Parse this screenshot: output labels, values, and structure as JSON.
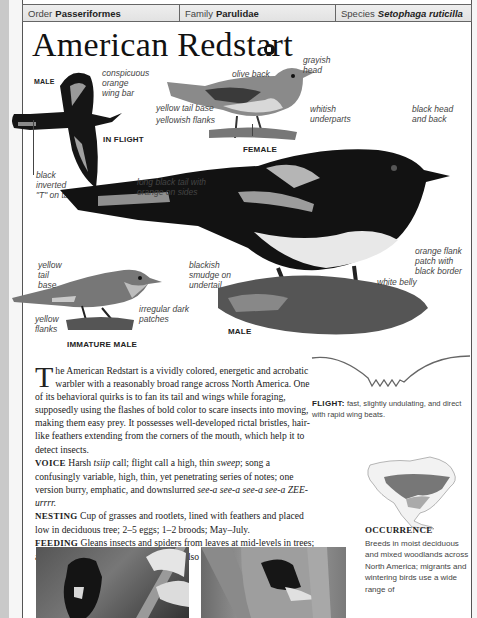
{
  "header": {
    "order_label": "Order",
    "order_value": "Passeriformes",
    "family_label": "Family",
    "family_value": "Parulidae",
    "species_label": "Species",
    "species_value": "Setophaga ruticilla"
  },
  "title": "American Redstart",
  "audio_icon": "speaker-icon",
  "illustrations": {
    "in_flight": {
      "tag": "MALE",
      "caption": "IN FLIGHT",
      "labels": [
        "conspicuous",
        "orange",
        "wing bar",
        "black",
        "inverted",
        "\"T\" on tail"
      ]
    },
    "female": {
      "caption": "FEMALE",
      "labels": [
        "grayish",
        "head",
        "olive back",
        "yellow tail base",
        "yellowish flanks",
        "whitish",
        "underparts"
      ]
    },
    "male": {
      "caption": "MALE",
      "labels": [
        "black head",
        "and back",
        "long black tail with",
        "orange on sides",
        "blackish",
        "smudge on",
        "undertail",
        "orange flank",
        "patch with",
        "black border",
        "white belly"
      ]
    },
    "immature_male": {
      "caption": "IMMATURE MALE",
      "labels": [
        "yellow",
        "tail",
        "base",
        "yellow",
        "flanks",
        "irregular dark",
        "patches"
      ]
    }
  },
  "description": {
    "dropcap": "T",
    "intro": "he American Redstart is a vividly colored, energetic and acrobatic warbler with a reasonably broad range across North America. One of its behavioral quirks is to fan its tail and wings while foraging, supposedly using the flashes of bold color to scare insects into moving, making them easy prey. It possesses well-developed rictal bristles, hair-like feathers extending from the corners of the mouth, which help it to detect insects.",
    "voice_label": "VOICE",
    "voice_text_1": " Harsh ",
    "voice_call": "tsiip",
    "voice_text_2": " call; flight call a high, thin ",
    "voice_flight": "sweep",
    "voice_text_3": "; song a confusingly variable, high, thin, yet penetrating series of notes; one version burry, emphatic, and downslurred ",
    "voice_song": "see-a see-a see-a see-a ZEE-urrrr.",
    "nesting_label": "NESTING",
    "nesting_text": " Cup of grasses and rootlets, lined with feathers and placed low in deciduous tree; 2–5 eggs; 1–2 broods; May–July.",
    "feeding_label": "FEEDING",
    "feeding_text": " Gleans insects and spiders from leaves at mid-levels in trees; also catches moths, flies in flight; will also eat fruit."
  },
  "flight": {
    "label": "FLIGHT:",
    "text": " fast, slightly undulating, and direct with rapid wing beats."
  },
  "occurrence": {
    "heading": "OCCURRENCE",
    "text": "Breeds in moist deciduous and mixed woodlands across North America; migrants and wintering birds use a wide range of"
  }
}
